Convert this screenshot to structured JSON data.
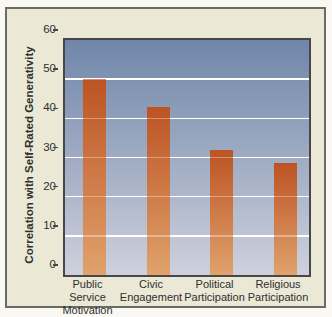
{
  "figure": {
    "kind": "scanned textbook bar chart figure",
    "title": ""
  },
  "chart_data": {
    "type": "bar",
    "categories": [
      "Public Service Motivation",
      "Civic Engagement",
      "Political Participation",
      "Religious Participation"
    ],
    "categories_wrapped": [
      [
        "Public",
        "Service",
        "Motivation"
      ],
      [
        "Civic",
        "Engagement"
      ],
      [
        "Political",
        "Participation"
      ],
      [
        "Religious",
        "Participation"
      ]
    ],
    "values": [
      50,
      43,
      32,
      28.5
    ],
    "title": "",
    "xlabel": "",
    "ylabel": "Correlation with Self-Rated Generativity",
    "ylim": [
      0,
      60
    ],
    "yticks": [
      0,
      10,
      20,
      30,
      40,
      50,
      60
    ],
    "gridlines_at": [
      10,
      20,
      30,
      40,
      50
    ],
    "grid": true,
    "legend": "none",
    "bar_style": "vertical gradient, dark orange top to light orange bottom",
    "plot_background": "vertical gradient, slate blue top to pale lavender bottom"
  },
  "colors": {
    "outer_bg": "#f9f8f2",
    "panel_bg": "#ebe8d6",
    "frame_border": "#6b6b65",
    "plot_border": "#47474a",
    "plot_top": "#7086a9",
    "plot_bottom": "#ced1dd",
    "bar_top": "#bc5323",
    "bar_bottom": "#e0a26c",
    "grid": "#ffffff",
    "text": "#2f2f2e"
  }
}
